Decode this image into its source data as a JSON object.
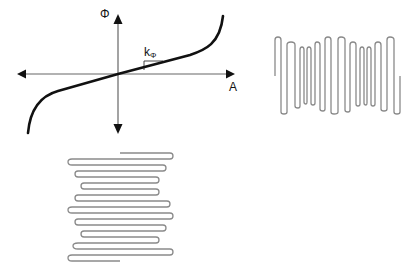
{
  "diagram": {
    "graph": {
      "y_axis_label": "Φ",
      "x_axis_label": "A",
      "slope_label_main": "k",
      "slope_label_sub": "Φ",
      "curve_color": "#111111",
      "axis_color": "#555555"
    },
    "serpentines": [
      {
        "name": "vertical-serpentine",
        "orientation": "vertical",
        "color": "#8a8a8a"
      },
      {
        "name": "horizontal-serpentine",
        "orientation": "horizontal",
        "color": "#8a8a8a"
      }
    ]
  }
}
